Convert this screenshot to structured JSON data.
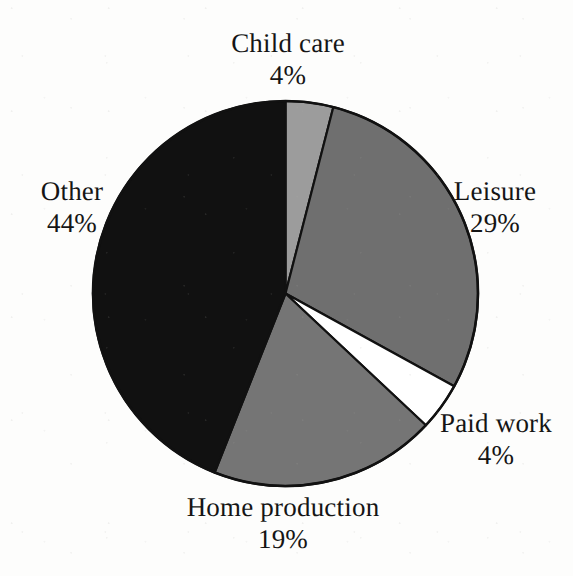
{
  "figure": {
    "background_color": "#fdfdfc",
    "outline_color": "#111111"
  },
  "chart_data": {
    "type": "pie",
    "title": "",
    "subtitle": "",
    "xlabel": "",
    "ylabel": "",
    "legend_position": "none",
    "grid": false,
    "labels_outside": true,
    "start_angle_deg": 0,
    "direction": "clockwise",
    "categories": [
      "Child care",
      "Leisure",
      "Paid work",
      "Home production",
      "Other"
    ],
    "values": [
      4,
      29,
      4,
      19,
      44
    ],
    "value_suffix": "%",
    "total": 100,
    "slice_colors": [
      "#9c9c9c",
      "#6f6f6f",
      "#ffffff",
      "#757575",
      "#111111"
    ],
    "slices": [
      {
        "name": "Child care",
        "value": 4,
        "value_text": "4%",
        "color": "#9c9c9c",
        "start_deg": 0,
        "end_deg": 14.4
      },
      {
        "name": "Leisure",
        "value": 29,
        "value_text": "29%",
        "color": "#6f6f6f",
        "start_deg": 14.4,
        "end_deg": 118.8
      },
      {
        "name": "Paid work",
        "value": 4,
        "value_text": "4%",
        "color": "#ffffff",
        "start_deg": 118.8,
        "end_deg": 133.2
      },
      {
        "name": "Home production",
        "value": 19,
        "value_text": "19%",
        "color": "#757575",
        "start_deg": 133.2,
        "end_deg": 201.6
      },
      {
        "name": "Other",
        "value": 44,
        "value_text": "44%",
        "color": "#111111",
        "start_deg": 201.6,
        "end_deg": 360
      }
    ]
  },
  "labels": {
    "child_care": {
      "name": "Child care",
      "value": "4%"
    },
    "leisure": {
      "name": "Leisure",
      "value": "29%"
    },
    "paid_work": {
      "name": "Paid work",
      "value": "4%"
    },
    "home_production": {
      "name": "Home production",
      "value": "19%"
    },
    "other": {
      "name": "Other",
      "value": "44%"
    }
  }
}
